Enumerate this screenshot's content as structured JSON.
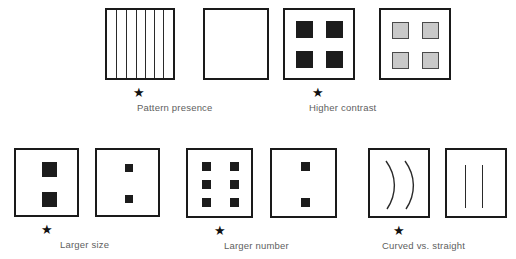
{
  "figure": {
    "title_visible": false,
    "background_color": "#ffffff",
    "line_color": "#1a1a1a",
    "dark_fill": "#1c1c1c",
    "gray_fill": "#c9c9c9",
    "caption_color": "#5e5e5e",
    "star_glyph": "★"
  },
  "comparisons": [
    {
      "id": "pattern-presence",
      "caption": "Pattern presence",
      "preferred_side": "left",
      "left": {
        "name": "striped-square",
        "description": "square filled with vertical stripes",
        "stripe_count": 7,
        "internal_line_count": 6
      },
      "right": {
        "name": "blank-square",
        "description": "empty square",
        "stripe_count": 0,
        "internal_line_count": 0
      }
    },
    {
      "id": "higher-contrast",
      "caption": "Higher contrast",
      "preferred_side": "left",
      "left": {
        "name": "dark-squares",
        "description": "four high-contrast black squares",
        "element_count": 4,
        "element_fill": "#1c1c1c"
      },
      "right": {
        "name": "gray-squares",
        "description": "four low-contrast gray squares",
        "element_count": 4,
        "element_fill": "#c9c9c9"
      }
    },
    {
      "id": "larger-size",
      "caption": "Larger size",
      "preferred_side": "left",
      "left": {
        "name": "large-squares",
        "description": "two large black squares",
        "element_count": 2,
        "element_size_px": 15
      },
      "right": {
        "name": "small-squares",
        "description": "two small black squares",
        "element_count": 2,
        "element_size_px": 8
      }
    },
    {
      "id": "larger-number",
      "caption": "Larger number",
      "preferred_side": "left",
      "left": {
        "name": "six-squares",
        "description": "six black squares in a 2 by 3 grid",
        "element_count": 6
      },
      "right": {
        "name": "two-squares",
        "description": "two black squares",
        "element_count": 2
      }
    },
    {
      "id": "curved-vs-straight",
      "caption": "Curved vs. straight",
      "preferred_side": "left",
      "left": {
        "name": "curved-lines",
        "description": "two curved arcs",
        "element_count": 2
      },
      "right": {
        "name": "straight-lines",
        "description": "two straight vertical lines",
        "element_count": 2
      }
    }
  ]
}
